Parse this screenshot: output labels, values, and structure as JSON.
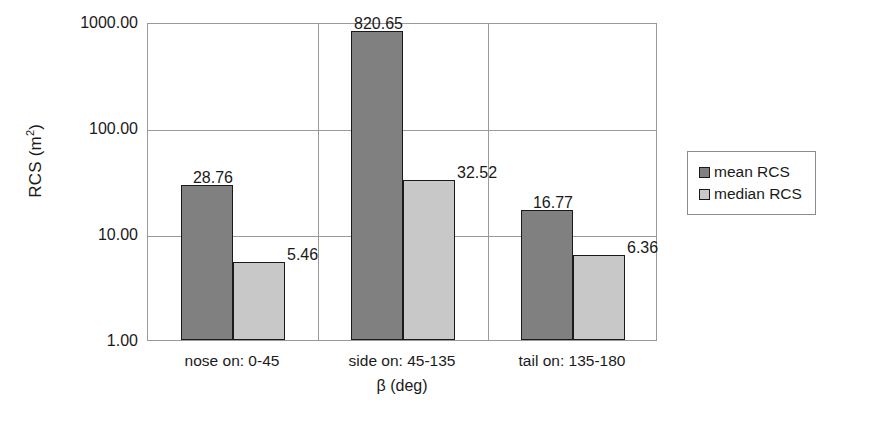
{
  "chart_data": {
    "type": "bar",
    "title": "",
    "xlabel": "β (deg)",
    "ylabel": "RCS (m2)",
    "ylabel_base": "RCS (m",
    "ylabel_sup": "2",
    "ylabel_close": ")",
    "yscale": "log",
    "ylim": [
      1.0,
      1000.0
    ],
    "ytick_labels": [
      "1000.00",
      "100.00",
      "10.00",
      "1.00"
    ],
    "ytick_values": [
      1000.0,
      100.0,
      10.0,
      1.0
    ],
    "grid": true,
    "legend_position": "right",
    "categories": [
      "nose on:  0-45",
      "side on: 45-135",
      "tail on: 135-180"
    ],
    "series": [
      {
        "name": "mean RCS",
        "color": "#808080",
        "values": [
          28.76,
          820.65,
          16.77
        ],
        "labels": [
          "28.76",
          "820.65",
          "16.77"
        ]
      },
      {
        "name": "median RCS",
        "color": "#c8c8c8",
        "values": [
          5.46,
          32.52,
          6.36
        ],
        "labels": [
          "5.46",
          "32.52",
          "6.36"
        ]
      }
    ]
  },
  "legend": {
    "items": [
      {
        "label": "mean RCS",
        "color": "#808080"
      },
      {
        "label": "median RCS",
        "color": "#c8c8c8"
      }
    ]
  },
  "colors": {
    "mean_rcs": "#808080",
    "median_rcs": "#c8c8c8",
    "axis": "#9a9a9a",
    "bar_outline": "#1a1a1a",
    "text": "#1a1a1a"
  }
}
